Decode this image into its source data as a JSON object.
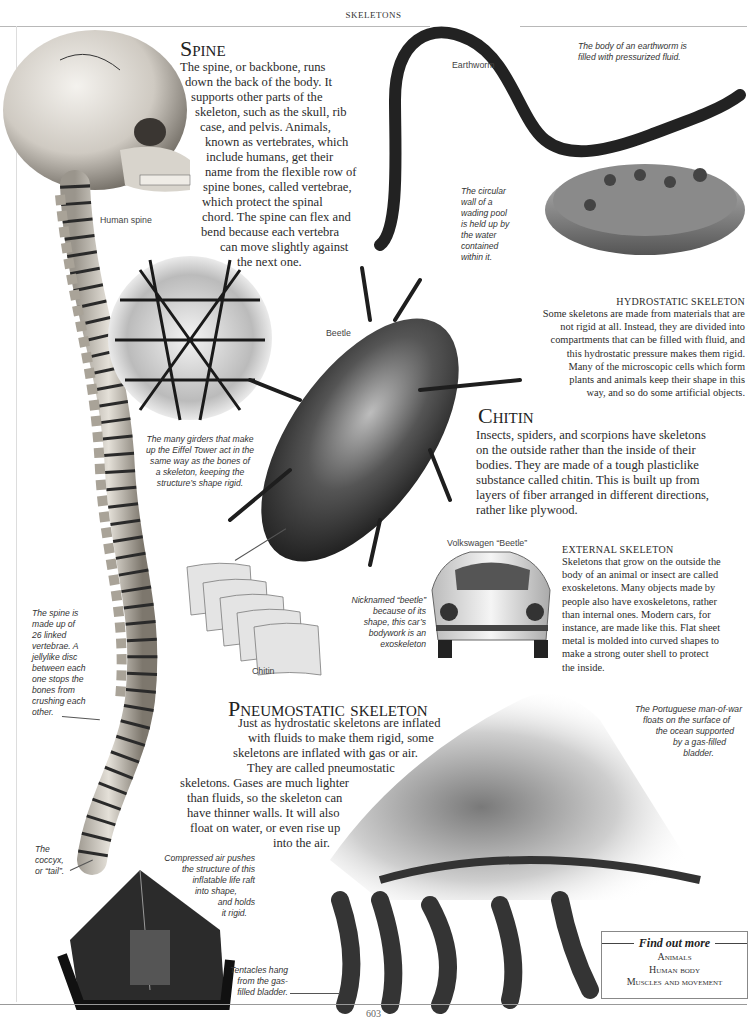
{
  "running_head": "SKELETONS",
  "page_number": "603",
  "spine": {
    "heading": "Spine",
    "lines": [
      "The spine, or backbone, runs",
      "down the back of the body. It",
      "supports other parts of the",
      "skeleton, such as the skull, rib",
      "case, and pelvis. Animals,",
      "known as vertebrates, which",
      "include humans, get their",
      "name from the flexible row of",
      "spine bones, called vertebrae,",
      "which protect the spinal",
      "chord. The spine can flex and",
      "bend because each vertebra",
      "can move slightly against",
      "the next one."
    ],
    "label": "Human spine",
    "caption_vertebrae": [
      "The spine is",
      "made up of",
      "26 linked",
      "vertebrae. A",
      "jellylike disc",
      "between each",
      "one stops the",
      "bones from",
      "crushing each",
      "other."
    ],
    "caption_coccyx": [
      "The",
      "coccyx,",
      "or “tail”."
    ]
  },
  "earthworm": {
    "label": "Earthworm",
    "caption": [
      "The body of an earthworm is",
      "filled with pressurized fluid."
    ]
  },
  "wading_pool": {
    "caption": [
      "The circular",
      "wall of a",
      "wading pool",
      "is held up by",
      "the water",
      "contained",
      "within it."
    ]
  },
  "hydrostatic": {
    "heading": "HYDROSTATIC SKELETON",
    "lines": [
      "Some skeletons are made from materials that are",
      "not rigid at all. Instead, they are divided into",
      "compartments that can be filled with fluid, and",
      "this hydrostatic pressure makes them rigid.",
      "Many of the microscopic cells which form",
      "plants and animals keep their shape in this",
      "way, and so do some artificial objects."
    ]
  },
  "eiffel": {
    "caption": [
      "The many girders that make",
      "up the Eiffel Tower act in the",
      "same way as the bones of",
      "a skeleton, keeping the",
      "structure’s shape rigid."
    ]
  },
  "beetle": {
    "label": "Beetle"
  },
  "chitin": {
    "heading": "Chitin",
    "lines": [
      "Insects, spiders, and scorpions have skeletons",
      "on the outside rather than the inside of their",
      "bodies. They are made of a tough plasticlike",
      "substance called chitin. This is built up from",
      "layers of fiber arranged in different directions,",
      "rather like plywood."
    ],
    "diagram_label": "Chitin"
  },
  "vw": {
    "label": "Volkswagen “Beetle”",
    "caption": [
      "Nicknamed “beetle”",
      "because of its",
      "shape, this car’s",
      "bodywork is an",
      "exoskeleton"
    ]
  },
  "external": {
    "heading": "EXTERNAL SKELETON",
    "lines": [
      "Skeletons that grow on the outside the",
      "body of an animal or insect are called",
      "exoskeletons. Many objects made by",
      "people also have exoskeletons, rather",
      "than internal ones. Modern cars, for",
      "instance, are made like this. Flat sheet",
      "metal is molded into curved shapes to",
      "make a strong outer shell to protect",
      "the inside."
    ]
  },
  "pneumostatic": {
    "heading": "Pneumostatic skeleton",
    "lines": [
      "Just as hydrostatic skeletons are inflated",
      "with fluids to make them rigid, some",
      "skeletons are inflated with gas or air.",
      "They are called pneumostatic",
      "skeletons. Gases are much lighter",
      "than fluids, so the skeleton can",
      "have thinner walls. It will also",
      "float on water, or even rise up",
      "into the air."
    ]
  },
  "man_of_war": {
    "caption": [
      "The Portuguese man-of-war",
      "floats on the surface of",
      "the ocean supported",
      "by a gas-filled",
      "bladder."
    ],
    "tentacles_caption": [
      "Tentacles hang",
      "from the gas-",
      "filled bladder."
    ]
  },
  "life_raft": {
    "caption": [
      "Compressed air pushes",
      "the structure of this",
      "inflatable life raft",
      "into shape,",
      "and holds",
      "it rigid."
    ]
  },
  "find_out_more": {
    "title": "Find out more",
    "links": [
      "Animals",
      "Human body",
      "Muscles and movement"
    ]
  },
  "colors": {
    "text": "#2a2a2a",
    "rule": "#b8b8b8",
    "caption": "#333333"
  }
}
